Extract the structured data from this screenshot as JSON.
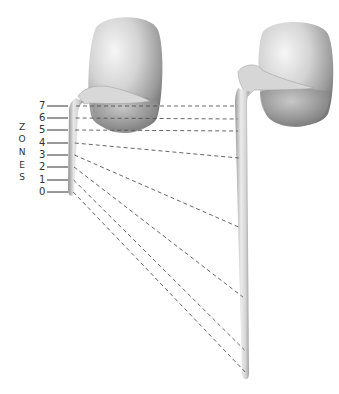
{
  "diagram": {
    "title_vertical": [
      "Z",
      "O",
      "N",
      "E",
      "S"
    ],
    "zones": [
      {
        "label": "7",
        "y": 106,
        "target_y": 106
      },
      {
        "label": "6",
        "y": 118,
        "target_y": 119
      },
      {
        "label": "5",
        "y": 130,
        "target_y": 131
      },
      {
        "label": "4",
        "y": 143,
        "target_y": 158
      },
      {
        "label": "3",
        "y": 155,
        "target_y": 228
      },
      {
        "label": "2",
        "y": 167,
        "target_y": 297
      },
      {
        "label": "1",
        "y": 180,
        "target_y": 350
      },
      {
        "label": "0",
        "y": 192,
        "target_y": 372
      }
    ],
    "left_figure": "contracted organ with short tube",
    "right_figure": "relaxed organ with elongated tube",
    "colors": {
      "organ_light": "#e8e8e8",
      "organ_mid": "#bdbdbd",
      "organ_dark": "#7a7a7a",
      "dash": "#555555",
      "text": "#333333"
    }
  }
}
